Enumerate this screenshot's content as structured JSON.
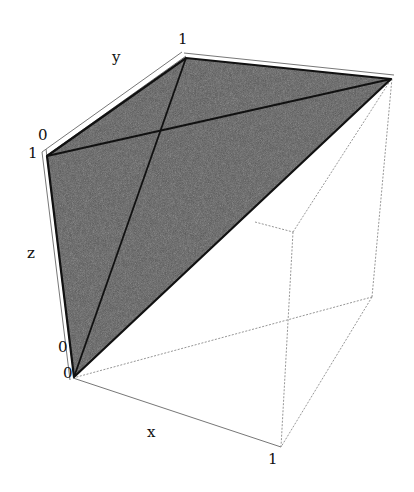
{
  "figure": {
    "type": "3d-box-plot",
    "fill_color": "#555555",
    "edge_color": "#111111",
    "box_color": "#888888"
  },
  "axes": {
    "x": {
      "label": "x",
      "ticks": [
        "0",
        "1"
      ]
    },
    "y": {
      "label": "y",
      "ticks": [
        "0",
        "1"
      ]
    },
    "z": {
      "label": "z",
      "ticks": [
        "0",
        "1"
      ]
    }
  },
  "vertices_3d": [
    {
      "name": "A",
      "coords": [
        0,
        0,
        0
      ]
    },
    {
      "name": "B",
      "coords": [
        0,
        0,
        1
      ]
    },
    {
      "name": "C",
      "coords": [
        0,
        1,
        1
      ]
    },
    {
      "name": "D",
      "coords": [
        1,
        1,
        1
      ]
    }
  ]
}
